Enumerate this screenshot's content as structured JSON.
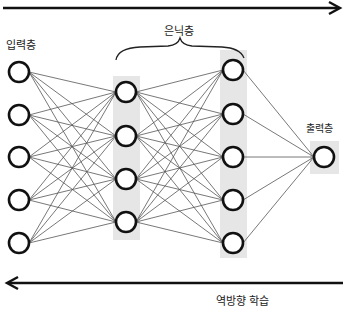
{
  "diagram": {
    "labels": {
      "input_layer": "입력층",
      "hidden_layer": "은닉층",
      "output_layer": "출력층",
      "backprop": "역방향 학습"
    },
    "layers": [
      {
        "name": "input",
        "x": 19,
        "nodes": [
          72,
          115,
          157,
          200,
          243
        ]
      },
      {
        "name": "hidden1",
        "x": 126,
        "nodes": [
          92,
          136,
          179,
          222
        ]
      },
      {
        "name": "hidden2",
        "x": 233,
        "nodes": [
          70,
          114,
          157,
          200,
          243
        ]
      },
      {
        "name": "output",
        "x": 324,
        "nodes": [
          157
        ]
      }
    ],
    "arrows": [
      {
        "name": "forward",
        "direction": "right",
        "y": 8
      },
      {
        "name": "backward",
        "direction": "left",
        "y": 283
      }
    ],
    "colors": {
      "node_stroke": "#111111",
      "edge": "#555555",
      "highlight": "#e6e6e6"
    }
  }
}
